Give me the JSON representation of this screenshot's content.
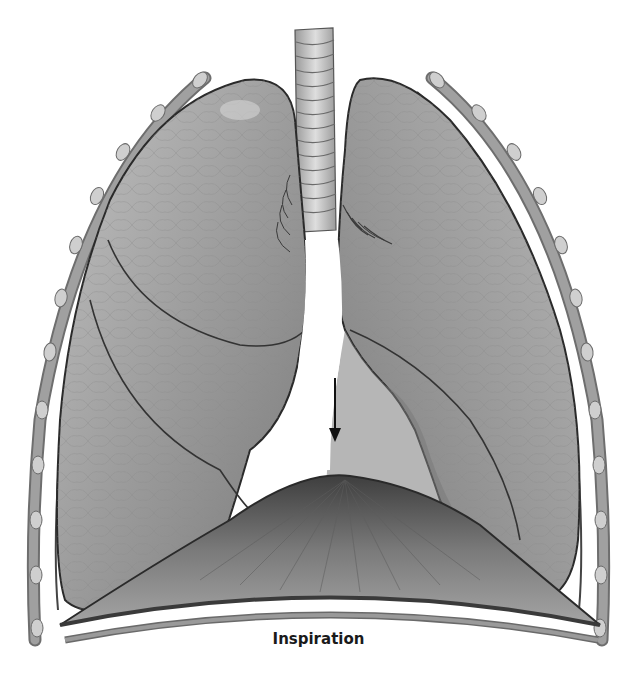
{
  "figure": {
    "caption": "Inspiration",
    "arrow_direction": "down",
    "colors": {
      "background": "#ffffff",
      "lung_fill": "#9a9a9a",
      "lung_light": "#b8b8b8",
      "outline": "#2a2a2a",
      "rib_fill": "#8c8c8c",
      "rib_nodule": "#c8c8c8",
      "diaphragm_dark": "#4a4a4a",
      "diaphragm_light": "#9c9c9c",
      "trachea": "#c4c4c4",
      "caption_text": "#1a1a1a"
    }
  }
}
